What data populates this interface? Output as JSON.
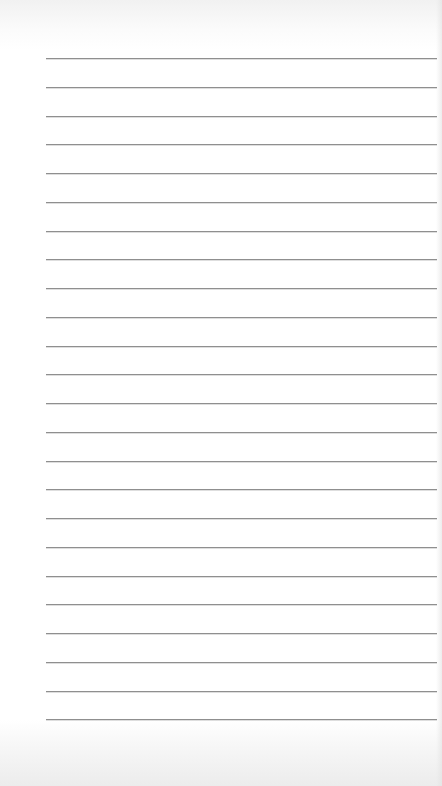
{
  "image": {
    "description": "Blank sheet of ruled notebook paper",
    "paper_color": "#ffffff",
    "line_color": "#8f8f8f",
    "ruled_lines": {
      "count": 24,
      "first_y": 58,
      "spacing": 28.75,
      "x_start": 46,
      "x_end": 437
    }
  }
}
